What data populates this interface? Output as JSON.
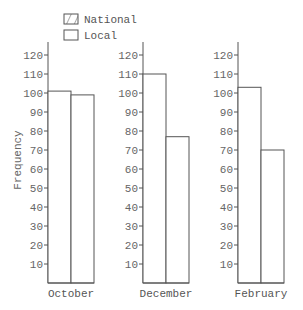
{
  "chart_data": {
    "type": "bar",
    "layout": "small-multiples",
    "title": "",
    "xlabel": "",
    "ylabel": "Frequency",
    "ylim": [
      0,
      125
    ],
    "yticks": [
      10,
      20,
      30,
      40,
      50,
      60,
      70,
      80,
      90,
      100,
      110,
      120
    ],
    "grid": false,
    "legend_position": "top-left",
    "categories": [
      "October",
      "December",
      "February"
    ],
    "series": [
      {
        "name": "National",
        "pattern": "diagonal-hatch",
        "values": [
          101,
          110,
          103
        ]
      },
      {
        "name": "Local",
        "pattern": "none",
        "values": [
          99,
          77,
          70
        ]
      }
    ]
  },
  "legend": {
    "items": [
      {
        "label": "National",
        "pattern": "hatch"
      },
      {
        "label": "Local",
        "pattern": "none"
      }
    ]
  },
  "colors": {
    "axis": "#555555",
    "text": "#666666",
    "bar_fill": "#ffffff",
    "hatch": "#555555"
  }
}
